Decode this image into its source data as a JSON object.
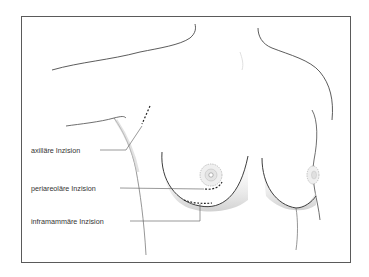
{
  "figure": {
    "type": "medical-illustration",
    "labels": [
      {
        "id": "axillary",
        "text": "axilläre Inzision"
      },
      {
        "id": "periareolar",
        "text": "periareoläre Inzision"
      },
      {
        "id": "inframammary",
        "text": "inframammäre Inzision"
      }
    ]
  },
  "colors": {
    "outline": "#4a4a4a",
    "shading": "#c8c8c8",
    "incision": "#222222",
    "frame": "#5a5a5a",
    "leader": "#555555"
  }
}
